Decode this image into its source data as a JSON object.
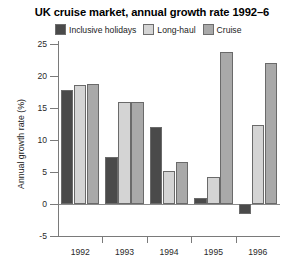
{
  "chart_data": {
    "type": "bar",
    "title": "UK cruise market, annual growth rate 1992–6",
    "xlabel": "",
    "ylabel": "Annual growth rate (%)",
    "categories": [
      "1992",
      "1993",
      "1994",
      "1995",
      "1996"
    ],
    "ylim": [
      -5,
      25
    ],
    "yticks": [
      -5,
      0,
      5,
      10,
      15,
      20,
      25
    ],
    "ytick_labels": [
      "-5",
      "0",
      "5",
      "10",
      "15",
      "20",
      "25"
    ],
    "grid": false,
    "legend_position": "top",
    "series": [
      {
        "name": "Inclusive holidays",
        "color": "#4a4a4a",
        "values": [
          17.8,
          7.3,
          12.0,
          1.0,
          -1.6
        ]
      },
      {
        "name": "Long-haul",
        "color": "#d4d4d4",
        "values": [
          18.6,
          15.9,
          5.2,
          4.2,
          12.4
        ]
      },
      {
        "name": "Cruise",
        "color": "#a9a9a9",
        "values": [
          18.7,
          15.9,
          6.6,
          23.8,
          22.1
        ]
      }
    ]
  },
  "axis": {
    "y_title": "Annual growth rate (%)"
  },
  "colors": {
    "inclusive_holidays": "#4a4a4a",
    "long_haul": "#d4d4d4",
    "cruise": "#a9a9a9",
    "axis": "#7a7a7a",
    "bar_outline": "#6a6a6a"
  }
}
